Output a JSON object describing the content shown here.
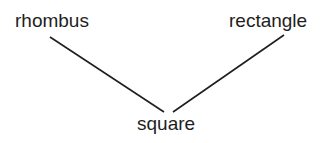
{
  "diagram": {
    "type": "hierarchy",
    "nodes": [
      {
        "id": "rhombus",
        "label": "rhombus"
      },
      {
        "id": "rectangle",
        "label": "rectangle"
      },
      {
        "id": "square",
        "label": "square"
      }
    ],
    "edges": [
      {
        "from": "rhombus",
        "to": "square"
      },
      {
        "from": "rectangle",
        "to": "square"
      }
    ],
    "line_color": "#1e1e1e"
  }
}
